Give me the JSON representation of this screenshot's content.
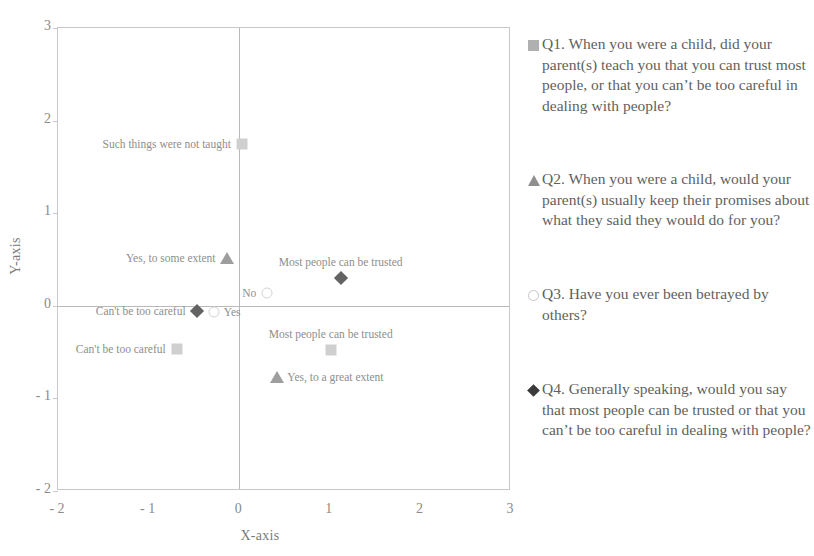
{
  "chart_data": {
    "type": "scatter",
    "title": "",
    "xlabel": "X-axis",
    "ylabel": "Y-axis",
    "xlim": [
      -2,
      3
    ],
    "ylim": [
      -2,
      3
    ],
    "xticks": [
      "- 2",
      "- 1",
      "0",
      "1",
      "2",
      "3"
    ],
    "xtick_values": [
      -2,
      -1,
      0,
      1,
      2,
      3
    ],
    "yticks": [
      "3",
      "2",
      "1",
      "0",
      "- 1",
      "- 2"
    ],
    "ytick_values": [
      3,
      2,
      1,
      0,
      -1,
      -2
    ],
    "grid": false,
    "zero_axes": true,
    "legend_position": "right",
    "series": [
      {
        "name": "Q1",
        "marker": "square",
        "color": "#cfcfcf",
        "points": [
          {
            "label": "Such things were not taught",
            "x": 0.03,
            "y": 1.75,
            "label_side": "left"
          },
          {
            "label": "Can't be too careful",
            "x": -0.69,
            "y": -0.47,
            "label_side": "left"
          },
          {
            "label": "Most people can be trusted",
            "x": 1.01,
            "y": -0.48,
            "label_side": "above"
          }
        ]
      },
      {
        "name": "Q2",
        "marker": "triangle",
        "color": "#9e9e9e",
        "points": [
          {
            "label": "Yes, to some extent",
            "x": -0.14,
            "y": 0.52,
            "label_side": "left"
          },
          {
            "label": "Yes, to a great extent",
            "x": 0.42,
            "y": -0.77,
            "label_side": "right"
          }
        ]
      },
      {
        "name": "Q3",
        "marker": "circle",
        "color": "#d5d5d5",
        "points": [
          {
            "label": "No",
            "x": 0.31,
            "y": 0.14,
            "label_side": "left"
          },
          {
            "label": "Yes",
            "x": -0.28,
            "y": -0.07,
            "label_side": "right"
          }
        ]
      },
      {
        "name": "Q4",
        "marker": "diamond",
        "color": "#636363",
        "points": [
          {
            "label": "Can't be too careful",
            "x": -0.47,
            "y": -0.06,
            "label_side": "left"
          },
          {
            "label": "Most people can be trusted",
            "x": 1.12,
            "y": 0.3,
            "label_side": "above"
          }
        ]
      }
    ],
    "legend_entries": [
      {
        "marker": "square",
        "color": "#b0b0b0",
        "text": "Q1. When you were a child, did your parent(s) teach you that you can trust most people, or that you can’t be too careful in dealing with people?"
      },
      {
        "marker": "triangle",
        "color": "#8f8f8f",
        "text": "Q2. When you were a child, would your parent(s) usually keep their promises about what they said they would do for you?"
      },
      {
        "marker": "circle",
        "color": "#d8d8d8",
        "text": "Q3. Have you ever been betrayed by others?"
      },
      {
        "marker": "diamond",
        "color": "#3a3a3a",
        "text": "Q4. Generally speaking, would you say that most people can be trusted or that you can’t be too careful in dealing with people?"
      }
    ]
  }
}
